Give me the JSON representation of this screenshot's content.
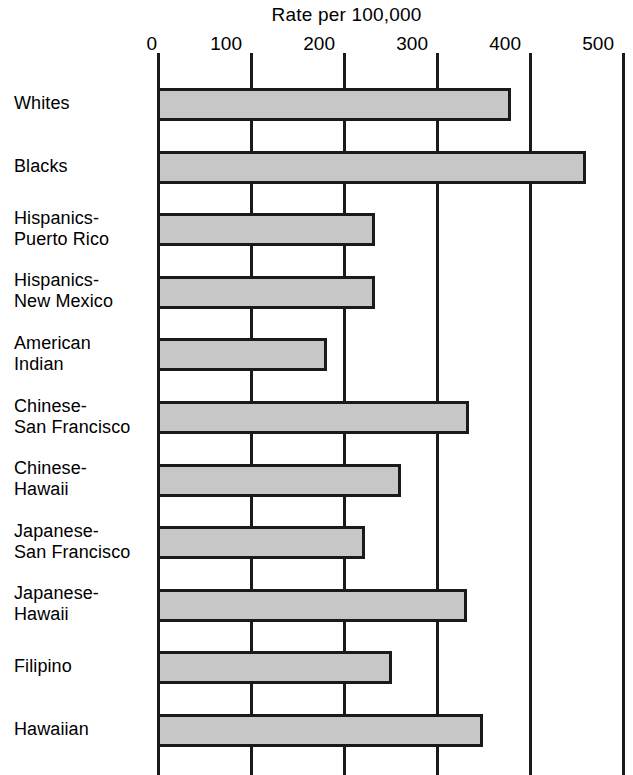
{
  "chart_data": {
    "type": "bar",
    "orientation": "horizontal",
    "title": "Rate per 100,000",
    "xlabel": "Rate per 100,000",
    "ylabel": "",
    "xlim": [
      0,
      500
    ],
    "xticks": [
      0,
      100,
      200,
      300,
      400,
      500
    ],
    "xtick_labels": [
      "0",
      "100",
      "200",
      "300",
      "400",
      "500"
    ],
    "grid": true,
    "grid_axis": "x",
    "legend": false,
    "categories": [
      "Whites",
      "Blacks",
      "Hispanics-\nPuerto Rico",
      "Hispanics-\nNew Mexico",
      "American\nIndian",
      "Chinese-\nSan Francisco",
      "Chinese-\nHawaii",
      "Japanese-\nSan Francisco",
      "Japanese-\nHawaii",
      "Filipino",
      "Hawaiian"
    ],
    "values": [
      381,
      461,
      234,
      234,
      183,
      336,
      262,
      224,
      333,
      253,
      350
    ],
    "bar_face_color": "#c7c7c7",
    "bar_edge_color": "#1a1a1a",
    "note": "Last bar (Hawaiian) is clipped by the bottom edge of the image"
  }
}
